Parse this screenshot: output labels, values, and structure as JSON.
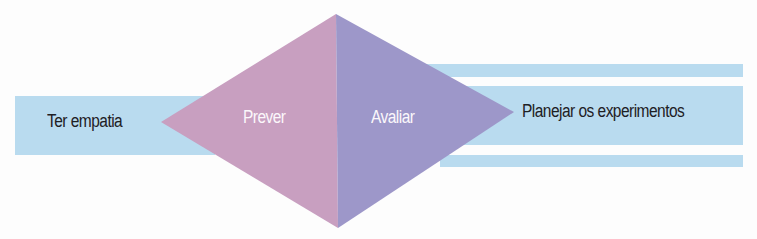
{
  "diagram": {
    "type": "process-diamond",
    "colors": {
      "band": "#b9dbef",
      "diamond_left": "#c89fc0",
      "diamond_right": "#9d97c9",
      "text_dark": "#1e2024",
      "text_light": "#fbf7fb"
    },
    "steps": [
      {
        "id": "empathize",
        "label": "Ter empatia",
        "position": "left-band"
      },
      {
        "id": "predict",
        "label": "Prever",
        "position": "diamond-left"
      },
      {
        "id": "evaluate",
        "label": "Avaliar",
        "position": "diamond-right"
      },
      {
        "id": "plan",
        "label": "Planejar os experimentos",
        "position": "right-band"
      }
    ]
  }
}
